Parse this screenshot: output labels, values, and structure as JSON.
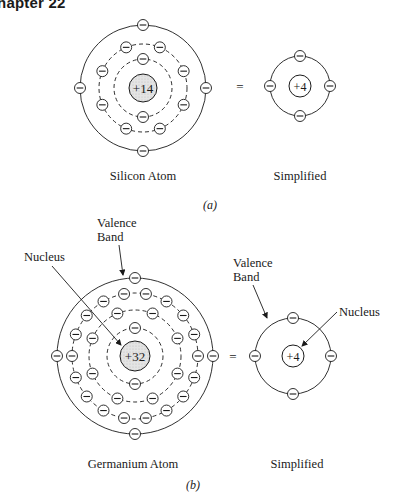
{
  "header": {
    "chapter_label": "Chapter 22"
  },
  "colors": {
    "ink": "#1a1a1a",
    "nucleus_fill": "#dcdcdc",
    "background": "#ffffff"
  },
  "panel_a": {
    "part_label": "(a)",
    "atom": {
      "caption": "Silicon Atom",
      "nucleus_charge": "+14",
      "shells": [
        {
          "style": "dashed",
          "electrons": 2
        },
        {
          "style": "dashed",
          "electrons": 8
        },
        {
          "style": "solid",
          "electrons": 4,
          "role": "valence"
        }
      ]
    },
    "equals": "=",
    "simplified": {
      "caption": "Simplified",
      "nucleus_charge": "+4",
      "valence_electrons": 4
    }
  },
  "panel_b": {
    "part_label": "(b)",
    "atom": {
      "caption": "Germanium Atom",
      "nucleus_charge": "+32",
      "shells": [
        {
          "style": "dashed",
          "electrons": 2
        },
        {
          "style": "dashed",
          "electrons": 8
        },
        {
          "style": "dashed",
          "electrons": 18
        },
        {
          "style": "solid",
          "electrons": 4,
          "role": "valence"
        }
      ],
      "labels": {
        "valence_line1": "Valence",
        "valence_line2": "Band",
        "nucleus": "Nucleus"
      }
    },
    "equals": "=",
    "simplified": {
      "caption": "Simplified",
      "nucleus_charge": "+4",
      "valence_electrons": 4,
      "labels": {
        "valence_line1": "Valence",
        "valence_line2": "Band",
        "nucleus": "Nucleus"
      }
    }
  },
  "electron_symbol": "−"
}
